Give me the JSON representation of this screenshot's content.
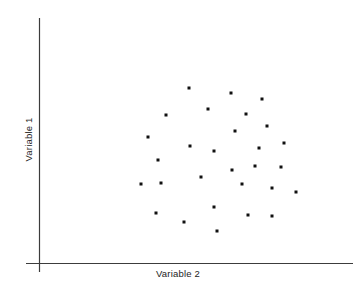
{
  "chart_data": {
    "type": "scatter",
    "title": "",
    "subtitle": "",
    "xlabel": "Variable 2",
    "ylabel": "Variable 1",
    "legend": [],
    "grid": false,
    "axis_style": {
      "x_axis": "solid line along bottom",
      "y_axis": "solid line along left",
      "ticks": "none",
      "tick_labels": "none",
      "axis_color": "#3c3c3c",
      "frame": "open (left and bottom spines only)"
    },
    "marker": {
      "shape": "square",
      "color": "#111111",
      "size_px": 3
    },
    "xlim": [
      0,
      1
    ],
    "ylim": [
      0,
      1
    ],
    "n_points": 29,
    "points_px": [
      [
        189,
        88
      ],
      [
        231,
        93
      ],
      [
        262,
        99
      ],
      [
        208,
        109
      ],
      [
        246,
        114
      ],
      [
        166,
        115
      ],
      [
        267,
        126
      ],
      [
        235,
        131
      ],
      [
        148,
        137
      ],
      [
        284,
        143
      ],
      [
        190,
        146
      ],
      [
        214,
        151
      ],
      [
        259,
        148
      ],
      [
        158,
        160
      ],
      [
        255,
        166
      ],
      [
        281,
        167
      ],
      [
        232,
        170
      ],
      [
        201,
        177
      ],
      [
        141,
        184
      ],
      [
        161,
        183
      ],
      [
        242,
        184
      ],
      [
        272,
        188
      ],
      [
        296,
        192
      ],
      [
        156,
        213
      ],
      [
        214,
        207
      ],
      [
        248,
        215
      ],
      [
        272,
        216
      ],
      [
        184,
        222
      ],
      [
        217,
        231
      ]
    ],
    "x": [
      0.478,
      0.611,
      0.71,
      0.538,
      0.658,
      0.405,
      0.724,
      0.623,
      0.347,
      0.778,
      0.481,
      0.557,
      0.7,
      0.379,
      0.687,
      0.769,
      0.614,
      0.516,
      0.323,
      0.386,
      0.642,
      0.738,
      0.814,
      0.37,
      0.557,
      0.665,
      0.738,
      0.462,
      0.567
    ],
    "y": [
      0.786,
      0.762,
      0.735,
      0.79,
      0.723,
      0.711,
      0.674,
      0.648,
      0.614,
      0.645,
      0.59,
      0.576,
      0.592,
      0.515,
      0.543,
      0.54,
      0.53,
      0.49,
      0.455,
      0.46,
      0.457,
      0.435,
      0.414,
      0.281,
      0.314,
      0.27,
      0.266,
      0.236,
      0.186
    ]
  },
  "axes": {
    "x_label": "Variable 2",
    "y_label": "Variable 1"
  }
}
